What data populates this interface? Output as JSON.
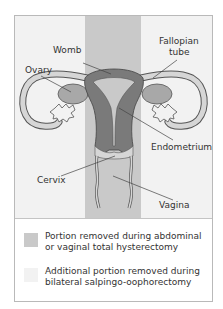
{
  "diagram": {
    "labels": {
      "womb": "Womb",
      "fallopian_tube": "Fallopian tube",
      "fallopian_line1": "Fallopian",
      "fallopian_line2": "tube",
      "ovary": "Ovary",
      "endometrium": "Endometrium",
      "cervix": "Cervix",
      "vagina": "Vagina"
    },
    "colors": {
      "background": "#f2f2f2",
      "band": "#c9c9c9",
      "organ_dark": "#7a7a7a",
      "organ_mid": "#a8a8a8",
      "organ_light": "#d6d6d6",
      "outline": "#555555"
    }
  },
  "legend": {
    "items": [
      {
        "label": "Portion removed during abdominal or vaginal total hysterectomy",
        "color": "#c9c9c9"
      },
      {
        "label": "Additional portion removed during bilateral salpingo-oophorectomy",
        "color": "#f2f2f2"
      }
    ]
  }
}
